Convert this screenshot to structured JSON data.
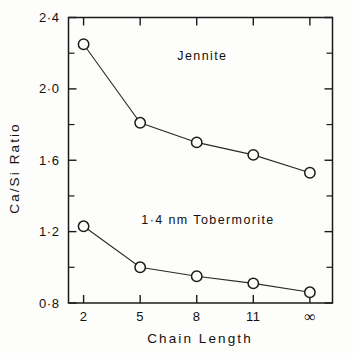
{
  "chart_data": {
    "type": "line",
    "title": "",
    "subtitle": "",
    "xlabel": "Chain Length",
    "ylabel": "Ca/Si Ratio",
    "categories": [
      "2",
      "5",
      "8",
      "11",
      "∞"
    ],
    "x_positions": [
      2,
      5,
      8,
      11,
      14
    ],
    "xlim": [
      1.2,
      15.2
    ],
    "ylim": [
      0.8,
      2.4
    ],
    "y_ticks": [
      "0·8",
      "1·2",
      "1·6",
      "2·0",
      "2·4"
    ],
    "y_tick_values": [
      0.8,
      1.2,
      1.6,
      2.0,
      2.4
    ],
    "y_minor_tick_values": [
      1.0,
      1.4,
      1.8,
      2.2
    ],
    "grid": false,
    "legend_position": "inline-annotation",
    "marker": "open-circle",
    "series": [
      {
        "name": "Jennite",
        "label": "Jennite",
        "label_x": 8.3,
        "label_y": 2.16,
        "values": [
          2.25,
          1.81,
          1.7,
          1.63,
          1.53
        ]
      },
      {
        "name": "1.4 nm Tobermorite",
        "label": "1·4 nm Tobermorite",
        "label_x": 8.6,
        "label_y": 1.245,
        "values": [
          1.23,
          1.0,
          0.95,
          0.91,
          0.86
        ]
      }
    ],
    "annotations": [],
    "colors": {
      "line": "#2a2a2a",
      "marker_edge": "#1b1b1b",
      "marker_fill": "#fdfdfb",
      "axis": "#1b1b1b",
      "text": "#111111",
      "background": "#fdfdfb"
    }
  }
}
